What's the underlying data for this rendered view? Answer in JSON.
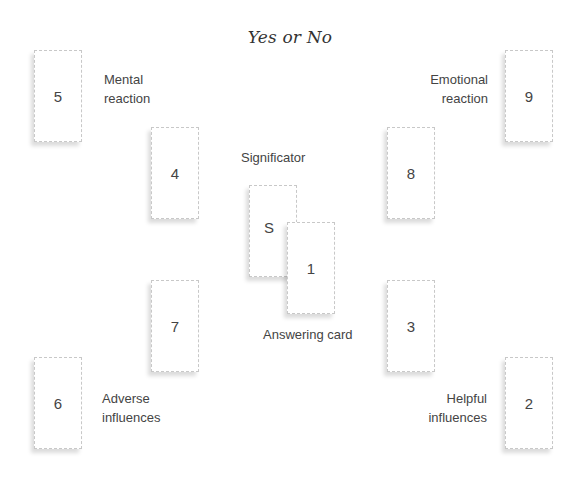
{
  "title": "Yes or No",
  "cards": {
    "c5": "5",
    "c4": "4",
    "cS": "S",
    "c1": "1",
    "c9": "9",
    "c8": "8",
    "c7": "7",
    "c3": "3",
    "c6": "6",
    "c2": "2"
  },
  "labels": {
    "mental_1": "Mental",
    "mental_2": "reaction",
    "emotional_1": "Emotional",
    "emotional_2": "reaction",
    "significator": "Significator",
    "answering": "Answering card",
    "adverse_1": "Adverse",
    "adverse_2": "influences",
    "helpful_1": "Helpful",
    "helpful_2": "influences"
  }
}
